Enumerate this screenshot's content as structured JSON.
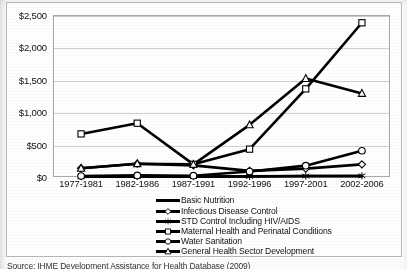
{
  "figure": {
    "source_note": "Source: IHME Development Assistance for Health Database (2009)"
  },
  "chart_data": {
    "type": "line",
    "title": "",
    "xlabel": "",
    "ylabel": "",
    "ylim": [
      0,
      2500
    ],
    "ytick_step": 500,
    "grid": true,
    "legend_position": "bottom",
    "currency_prefix": "$",
    "categories": [
      "1977-1981",
      "1982-1986",
      "1987-1991",
      "1992-1996",
      "1997-2001",
      "2002-2006"
    ],
    "ytick_labels": [
      "$0",
      "$500",
      "$1,000",
      "$1,500",
      "$2,000",
      "$2,500"
    ],
    "ytick_values": [
      0,
      500,
      1000,
      1500,
      2000,
      2500
    ],
    "series": [
      {
        "name": "Basic Nutrition",
        "marker": "none",
        "values": [
          5,
          8,
          6,
          10,
          14,
          12
        ]
      },
      {
        "name": "Infectious Disease Control",
        "marker": "diamond",
        "values": [
          135,
          205,
          180,
          95,
          130,
          195
        ]
      },
      {
        "name": "STD Control Including HIV/AIDS",
        "marker": "asterisk",
        "values": [
          4,
          6,
          5,
          8,
          15,
          18
        ]
      },
      {
        "name": "Maternal Health and Perinatal Conditions",
        "marker": "square",
        "values": [
          665,
          830,
          195,
          430,
          1360,
          2380
        ]
      },
      {
        "name": "Water Sanitation",
        "marker": "circle",
        "values": [
          15,
          25,
          20,
          85,
          175,
          405
        ]
      },
      {
        "name": "General Health Sector Development",
        "marker": "triangle",
        "values": [
          135,
          205,
          195,
          805,
          1520,
          1290
        ]
      }
    ]
  }
}
